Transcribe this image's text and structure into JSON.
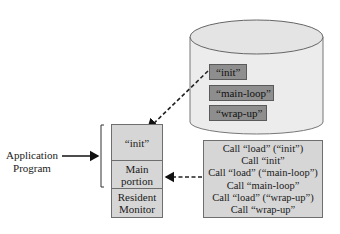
{
  "diagram": {
    "application_label": [
      "Application",
      "Program"
    ],
    "memory_segments": [
      {
        "label": "“init”"
      },
      {
        "label": "Main portion",
        "lines": [
          "Main",
          "portion"
        ]
      },
      {
        "label": "Resident Monitor",
        "lines": [
          "Resident",
          "Monitor"
        ]
      }
    ],
    "disk_modules": [
      {
        "label": "“init”"
      },
      {
        "label": "“main-loop”"
      },
      {
        "label": "“wrap-up”"
      }
    ],
    "call_sequence": [
      "Call “load” (“init”)",
      "Call “init”",
      "Call “load” (“main-loop”)",
      "Call “main-loop”",
      "Call “load” (“wrap-up”)",
      "Call “wrap-up”"
    ],
    "colors": {
      "memory_fill": "#d6d6d6",
      "disk_fill": "#ececec",
      "module_fill": "#8e8e8e",
      "outline": "#6e6e6e"
    }
  }
}
